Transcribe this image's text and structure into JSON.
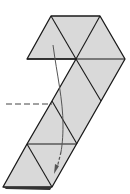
{
  "diagram": {
    "type": "origami-fold-diagram",
    "colors": {
      "background": "#ffffff",
      "paper_fill": "#d9d9d9",
      "edge": "#1a1a1a",
      "arrow": "#555555",
      "fold_line": "#444444"
    },
    "elements": {
      "paper": "triangle-grid strip (hexagon top, diagonal band)",
      "fold_indicator": "dashed horizontal line at left",
      "fold_arrow": "curved arrow with dashed tail pointing down"
    }
  }
}
